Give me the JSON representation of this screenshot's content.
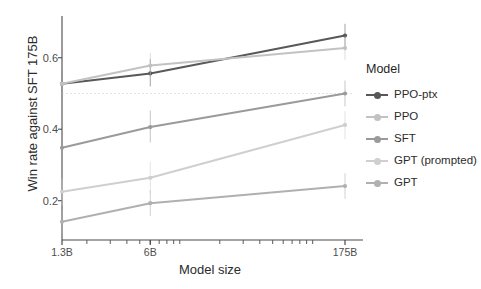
{
  "chart_data": {
    "type": "line",
    "title": "",
    "xlabel": "Model size",
    "ylabel": "Win rate against SFT 175B",
    "x": [
      1.3,
      6,
      175
    ],
    "xtick_labels": [
      "1.3B",
      "6B",
      "175B"
    ],
    "xscale": "log",
    "ytick_labels": [
      "0.2",
      "0.4",
      "0.6"
    ],
    "ytick_values": [
      0.2,
      0.4,
      0.6
    ],
    "ylim": [
      0.09,
      0.7
    ],
    "grid": false,
    "reference_line": 0.5,
    "legend_title": "Model",
    "legend_position": "right",
    "series": [
      {
        "name": "PPO-ptx",
        "color": "#585858",
        "values": [
          0.527,
          0.556,
          0.662
        ],
        "err_low": [
          0.487,
          0.52,
          0.63
        ],
        "err_high": [
          0.567,
          0.596,
          0.695
        ]
      },
      {
        "name": "PPO",
        "color": "#c2c2c2",
        "values": [
          0.527,
          0.578,
          0.627
        ],
        "err_low": [
          0.487,
          0.541,
          0.594
        ],
        "err_high": [
          0.567,
          0.613,
          0.66
        ]
      },
      {
        "name": "SFT",
        "color": "#9a9a9a",
        "values": [
          0.348,
          0.406,
          0.5
        ],
        "err_low": [
          0.305,
          0.363,
          0.464
        ],
        "err_high": [
          0.392,
          0.452,
          0.536
        ]
      },
      {
        "name": "GPT (prompted)",
        "color": "#cfcfcf",
        "values": [
          0.225,
          0.264,
          0.412
        ],
        "err_low": [
          0.186,
          0.22,
          0.372
        ],
        "err_high": [
          0.262,
          0.308,
          0.45
        ]
      },
      {
        "name": "GPT",
        "color": "#b0b0b0",
        "values": [
          0.141,
          0.193,
          0.241
        ],
        "err_low": [
          0.107,
          0.157,
          0.205
        ],
        "err_high": [
          0.175,
          0.229,
          0.277
        ]
      }
    ]
  },
  "axis": {
    "ylabel": "Win rate against SFT 175B",
    "xlabel": "Model size"
  },
  "legend": {
    "title": "Model",
    "items": [
      {
        "label": "PPO-ptx"
      },
      {
        "label": "PPO"
      },
      {
        "label": "SFT"
      },
      {
        "label": "GPT (prompted)"
      },
      {
        "label": "GPT"
      }
    ]
  }
}
